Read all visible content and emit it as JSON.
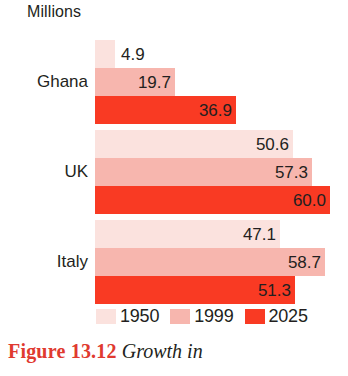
{
  "unit_label": "Millions",
  "caption": {
    "figure_number": "Figure 13.12",
    "text": "Growth in"
  },
  "legend": {
    "items": [
      {
        "label": "1950",
        "color": "#FBE2DE"
      },
      {
        "label": "1999",
        "color": "#F7B6AE"
      },
      {
        "label": "2025",
        "color": "#F93A23"
      }
    ]
  },
  "chart_data": {
    "type": "bar",
    "orientation": "horizontal",
    "title": "Millions",
    "xlabel": "Millions",
    "ylabel": "",
    "grid": false,
    "legend_position": "bottom",
    "categories": [
      "Ghana",
      "UK",
      "Italy"
    ],
    "series": [
      {
        "name": "1950",
        "color": "#FBE2DE",
        "values": [
          4.9,
          50.6,
          47.1
        ]
      },
      {
        "name": "1999",
        "color": "#F7B6AE",
        "values": [
          19.7,
          57.3,
          58.7
        ]
      },
      {
        "name": "2025",
        "color": "#F93A23",
        "values": [
          36.9,
          60.0,
          51.3
        ]
      }
    ],
    "value_labels": {
      "Ghana": [
        "4.9",
        "19.7",
        "36.9"
      ],
      "UK": [
        "50.6",
        "57.3",
        "60.0"
      ],
      "Italy": [
        "47.1",
        "58.7",
        "51.3"
      ]
    },
    "xlim": [
      0,
      62
    ]
  },
  "groups": [
    {
      "label": "Ghana",
      "bars": [
        {
          "series": "1950",
          "value": "4.9",
          "width_px": 20,
          "color": "#FBE2DE",
          "label_inside": false
        },
        {
          "series": "1999",
          "value": "19.7",
          "width_px": 80,
          "color": "#F7B6AE",
          "label_inside": true
        },
        {
          "series": "2025",
          "value": "36.9",
          "width_px": 141,
          "color": "#F93A23",
          "label_inside": true
        }
      ]
    },
    {
      "label": "UK",
      "bars": [
        {
          "series": "1950",
          "value": "50.6",
          "width_px": 198,
          "color": "#FBE2DE",
          "label_inside": true
        },
        {
          "series": "1999",
          "value": "57.3",
          "width_px": 217,
          "color": "#F7B6AE",
          "label_inside": true
        },
        {
          "series": "2025",
          "value": "60.0",
          "width_px": 235,
          "color": "#F93A23",
          "label_inside": true
        }
      ]
    },
    {
      "label": "Italy",
      "bars": [
        {
          "series": "1950",
          "value": "47.1",
          "width_px": 185,
          "color": "#FBE2DE",
          "label_inside": true
        },
        {
          "series": "1999",
          "value": "58.7",
          "width_px": 230,
          "color": "#F7B6AE",
          "label_inside": true
        },
        {
          "series": "2025",
          "value": "51.3",
          "width_px": 200,
          "color": "#F93A23",
          "label_inside": true
        }
      ]
    }
  ]
}
